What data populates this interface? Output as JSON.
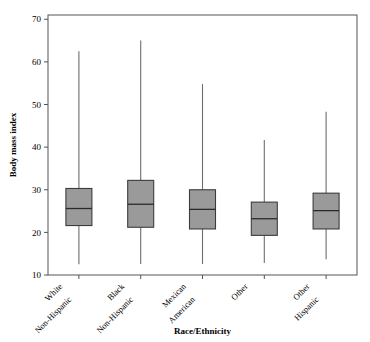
{
  "chart_data": {
    "type": "box",
    "title": "",
    "xlabel": "Race/Ethnicity",
    "ylabel": "Body mass index",
    "ylim": [
      10,
      71
    ],
    "yticks": [
      10,
      20,
      30,
      40,
      50,
      60,
      70
    ],
    "ytick_labels": [
      "10",
      "20",
      "30",
      "40",
      "50",
      "60",
      "70"
    ],
    "grid": false,
    "legend": "none",
    "box_fill_color": "#9a9a9a",
    "box_edge_color": "#3c3c3c",
    "whisker_color": "#6e6e6e",
    "axis_color": "#555555",
    "categories": [
      "White Non-Hispanic",
      "Black Non-Hispanic",
      "Mexican American",
      "Other",
      "Other Hispanic"
    ],
    "category_lines": [
      [
        "White",
        "Non-Hispanic"
      ],
      [
        "Black",
        "Non-Hispanic"
      ],
      [
        "Mexican",
        "American"
      ],
      [
        "Other",
        ""
      ],
      [
        "Other",
        "Hispanic"
      ]
    ],
    "boxes": [
      {
        "category": "White Non-Hispanic",
        "whisker_low": 12.5,
        "q1": 21.6,
        "median": 25.6,
        "q3": 30.3,
        "whisker_high": 62.5
      },
      {
        "category": "Black Non-Hispanic",
        "whisker_low": 12.6,
        "q1": 21.2,
        "median": 26.6,
        "q3": 32.2,
        "whisker_high": 65.0
      },
      {
        "category": "Mexican American",
        "whisker_low": 12.6,
        "q1": 20.8,
        "median": 25.4,
        "q3": 30.0,
        "whisker_high": 54.8
      },
      {
        "category": "Other",
        "whisker_low": 12.8,
        "q1": 19.3,
        "median": 23.2,
        "q3": 27.1,
        "whisker_high": 41.7
      },
      {
        "category": "Other Hispanic",
        "whisker_low": 13.7,
        "q1": 20.8,
        "median": 25.1,
        "q3": 29.2,
        "whisker_high": 48.3
      }
    ]
  }
}
